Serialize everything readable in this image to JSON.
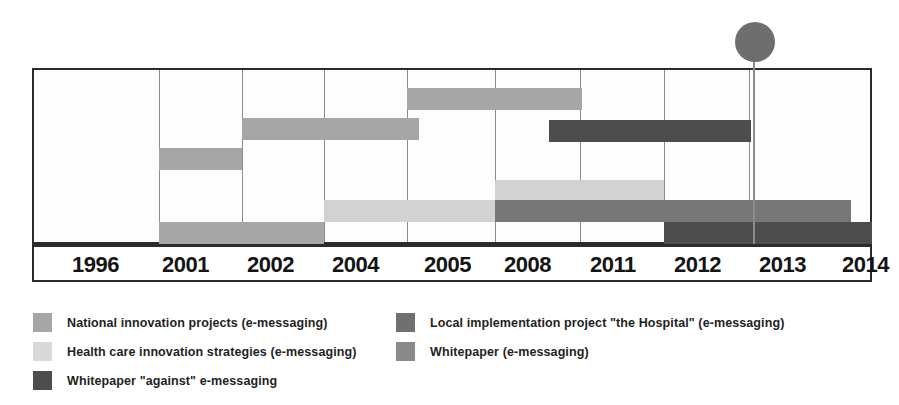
{
  "chart_data": {
    "type": "bar",
    "title": "",
    "subtitle": "",
    "xlabel": "",
    "ylabel": "",
    "orientation": "horizontal",
    "grid": true,
    "legend_position": "bottom",
    "axis_ticks": [
      "1996",
      "2001",
      "2002",
      "2004",
      "2005",
      "2008",
      "2011",
      "2012",
      "2013",
      "2014"
    ],
    "axis_tick_positions_px": [
      32,
      157,
      240,
      322,
      405,
      493,
      578,
      662,
      747,
      872
    ],
    "x_axis_range": [
      "1996",
      "2014"
    ],
    "marker": {
      "label": "",
      "at_tick": "2013",
      "shape": "circle",
      "color": "#6e6e6e"
    },
    "series": [
      {
        "name": "National innovation projects (e-messaging)",
        "color": "#a6a6a6",
        "bars": [
          {
            "start_tick": "2001",
            "end_tick": "2002",
            "row": 2
          },
          {
            "start_tick": "2001",
            "end_tick": "2004",
            "row": 5
          },
          {
            "start_tick": "2002",
            "end_tick": "2005",
            "row": 1
          },
          {
            "start_tick": "2005",
            "end_tick": "2011",
            "row": 0
          }
        ]
      },
      {
        "name": "Health care innovation strategies  (e-messaging)",
        "color": "#d2d2d2",
        "bars": [
          {
            "start_tick": "1996",
            "end_tick": "2001",
            "row": 6
          },
          {
            "start_tick": "2004",
            "end_tick": "2008",
            "row": 4
          },
          {
            "start_tick": "2008",
            "end_tick": "2012",
            "row": 3
          }
        ]
      },
      {
        "name": "Local implementation project \"the Hospital\" (e-messaging)",
        "color": "#777777",
        "bars": [
          {
            "start_tick": "2008",
            "end_tick": "2014",
            "row": 4
          }
        ]
      },
      {
        "name": "Whitepaper \"against\" e-messaging",
        "color": "#4d4d4d",
        "bars": [
          {
            "start_tick": "2011",
            "end_tick": "2013",
            "row": 1
          },
          {
            "start_tick": "2012",
            "end_tick": "2014",
            "row": 5
          }
        ]
      }
    ]
  },
  "axis": {
    "ticks": [
      {
        "label": "1996",
        "x": 38
      },
      {
        "label": "2001",
        "x": 128
      },
      {
        "label": "2002",
        "x": 213
      },
      {
        "label": "2004",
        "x": 298
      },
      {
        "label": "2005",
        "x": 390
      },
      {
        "label": "2008",
        "x": 470
      },
      {
        "label": "2011",
        "x": 556
      },
      {
        "label": "2012",
        "x": 640
      },
      {
        "label": "2013",
        "x": 725
      },
      {
        "label": "2014",
        "x": 808
      }
    ]
  },
  "gridlines": [
    {
      "x": 125
    },
    {
      "x": 208
    },
    {
      "x": 290
    },
    {
      "x": 373
    },
    {
      "x": 461
    },
    {
      "x": 546
    },
    {
      "x": 630
    },
    {
      "x": 715
    }
  ],
  "bars": [
    {
      "name": "bar-national-2005-2011",
      "left": 373,
      "width": 175,
      "top": 18,
      "color": "#a6a6a6"
    },
    {
      "name": "bar-national-2002-2005",
      "left": 208,
      "width": 177,
      "top": 48,
      "color": "#a6a6a6"
    },
    {
      "name": "bar-whitepaper-against-2011-2013",
      "left": 515,
      "width": 202,
      "top": 50,
      "color": "#4d4d4d"
    },
    {
      "name": "bar-national-2001-2002",
      "left": 125,
      "width": 83,
      "top": 78,
      "color": "#a6a6a6"
    },
    {
      "name": "bar-health-2008-2012",
      "left": 461,
      "width": 169,
      "top": 110,
      "color": "#d2d2d2"
    },
    {
      "name": "bar-health-2004-2008",
      "left": 290,
      "width": 171,
      "top": 130,
      "color": "#d2d2d2"
    },
    {
      "name": "bar-local-2008-2014",
      "left": 461,
      "width": 356,
      "top": 130,
      "color": "#777777"
    },
    {
      "name": "bar-national-2001-2004",
      "left": 125,
      "width": 165,
      "top": 152,
      "color": "#a6a6a6"
    },
    {
      "name": "bar-whitepaper-against-2012-2014",
      "left": 630,
      "width": 208,
      "top": 152,
      "color": "#4d4d4d"
    },
    {
      "name": "bar-health-1996-2001",
      "left": 38,
      "width": 87,
      "top": 174,
      "color": "#d2d2d2"
    }
  ],
  "marker": {
    "dot_left": 735,
    "dot_top": 22,
    "dot_size": 40,
    "line_left": 753,
    "line_top": 62,
    "line_height": 182,
    "color": "#6e6e6e",
    "line_color": "#8c8c8c"
  },
  "legend": {
    "items": [
      {
        "label": "National innovation projects (e-messaging)",
        "color": "#a6a6a6",
        "left": 33,
        "top": 13
      },
      {
        "label": "Health care innovation strategies  (e-messaging)",
        "color": "#d9d9d9",
        "left": 33,
        "top": 42
      },
      {
        "label": "Whitepaper \"against\" e-messaging",
        "color": "#4d4d4d",
        "left": 33,
        "top": 71
      },
      {
        "label": "Local implementation project \"the Hospital\" (e-messaging)",
        "color": "#707070",
        "left": 396,
        "top": 13
      },
      {
        "label": "Whitepaper   (e-messaging)",
        "color": "#8a8a8a",
        "left": 396,
        "top": 42
      }
    ]
  }
}
